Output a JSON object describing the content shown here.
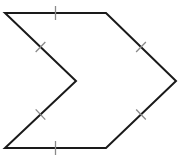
{
  "diagram": {
    "type": "concave-hexagon",
    "vertices": [
      {
        "name": "top-left",
        "x": 5,
        "y": 13
      },
      {
        "name": "top-right",
        "x": 106,
        "y": 13
      },
      {
        "name": "right-point",
        "x": 176,
        "y": 81
      },
      {
        "name": "bottom-right",
        "x": 106,
        "y": 148
      },
      {
        "name": "bottom-left",
        "x": 5,
        "y": 148
      },
      {
        "name": "inner-notch",
        "x": 76,
        "y": 81
      }
    ],
    "tick_marks": 6,
    "colors": {
      "stroke": "#1a1a1a",
      "tick": "#8a8a8a",
      "background": "#ffffff"
    }
  }
}
